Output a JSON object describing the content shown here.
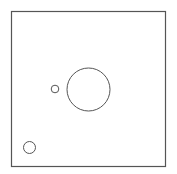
{
  "canvas": {
    "width": 177,
    "height": 174,
    "background": "#ffffff"
  },
  "frame": {
    "x": 11.5,
    "y": 11.5,
    "width": 154,
    "height": 155,
    "stroke": "#555555",
    "stroke_width": 1.2
  },
  "shapes": [
    {
      "type": "circle",
      "name": "large-circle",
      "cx": 88.5,
      "cy": 89.5,
      "r": 21.5,
      "stroke": "#555555"
    },
    {
      "type": "circle",
      "name": "small-circle",
      "cx": 55,
      "cy": 89,
      "r": 3.8,
      "stroke": "#555555"
    },
    {
      "type": "circle",
      "name": "bottom-left-circle",
      "cx": 29.5,
      "cy": 147.5,
      "r": 6,
      "stroke": "#555555"
    }
  ]
}
